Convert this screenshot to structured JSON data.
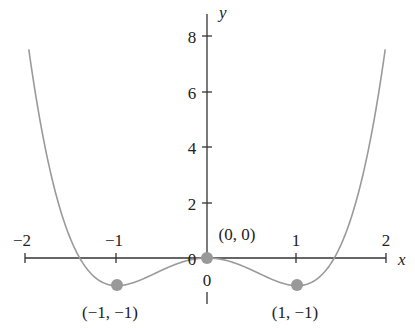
{
  "chart_data": {
    "type": "line",
    "function": "y = x^4 - 2x^2",
    "xlabel": "x",
    "ylabel": "y",
    "xlim": [
      -2,
      2
    ],
    "ylim": [
      -1,
      8
    ],
    "x_ticks": [
      "-2",
      "-1",
      "1",
      "2"
    ],
    "y_ticks": [
      "2",
      "4",
      "6",
      "8"
    ],
    "origin_labels": [
      "0",
      "0"
    ],
    "points": [
      {
        "x": -1,
        "y": -1,
        "label": "(-1, -1)"
      },
      {
        "x": 0,
        "y": 0,
        "label": "(0, 0)"
      },
      {
        "x": 1,
        "y": -1,
        "label": "(1, -1)"
      }
    ],
    "line_color": "#9a9a9a",
    "point_color": "#999999",
    "grid": false
  },
  "labels": {
    "x_axis": "x",
    "y_axis": "y",
    "xt_m2": "−2",
    "xt_m1": "−1",
    "xt_1": "1",
    "xt_2": "2",
    "yt_2": "2",
    "yt_4": "4",
    "yt_6": "6",
    "yt_8": "8",
    "zero_left": "0",
    "zero_below": "0",
    "pt_left": "(−1, −1)",
    "pt_origin": "(0, 0)",
    "pt_right": "(1, −1)"
  }
}
